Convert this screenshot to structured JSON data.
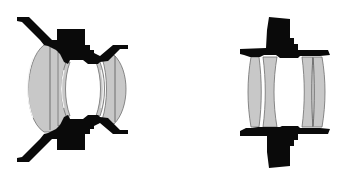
{
  "figure": {
    "colors": {
      "background": "#ffffff",
      "barrel": "#0a0a0a",
      "glass": "#c8c8c8",
      "glass_edge": "#6e6e6e"
    },
    "diagrams": [
      {
        "id": "left-lens",
        "type": "wide-angle lens cross-section",
        "elements": [
          "large front meniscus",
          "inner meniscus",
          "inner meniscus",
          "rear doublet"
        ]
      },
      {
        "id": "right-lens",
        "type": "symmetric lens cross-section",
        "elements": [
          "front element 1",
          "front element 2",
          "rear element 1",
          "rear element 2"
        ]
      }
    ]
  }
}
